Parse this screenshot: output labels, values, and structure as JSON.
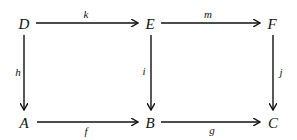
{
  "diagram": {
    "type": "commutative-diagram",
    "nodes": {
      "D": {
        "label": "D",
        "x": 24,
        "y": 23
      },
      "E": {
        "label": "E",
        "x": 150,
        "y": 23
      },
      "F": {
        "label": "F",
        "x": 272,
        "y": 23
      },
      "A": {
        "label": "A",
        "x": 24,
        "y": 122
      },
      "B": {
        "label": "B",
        "x": 150,
        "y": 122
      },
      "C": {
        "label": "C",
        "x": 272,
        "y": 122
      }
    },
    "edges": {
      "k": {
        "label": "k",
        "from": "D",
        "to": "E"
      },
      "m": {
        "label": "m",
        "from": "E",
        "to": "F"
      },
      "h": {
        "label": "h",
        "from": "D",
        "to": "A"
      },
      "i": {
        "label": "i",
        "from": "E",
        "to": "B"
      },
      "j": {
        "label": "j",
        "from": "F",
        "to": "C"
      },
      "f": {
        "label": "f",
        "from": "A",
        "to": "B"
      },
      "g": {
        "label": "g",
        "from": "B",
        "to": "C"
      }
    }
  }
}
